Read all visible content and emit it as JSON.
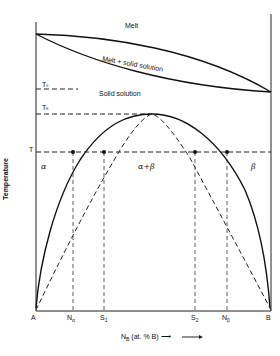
{
  "diagram": {
    "type": "phase-diagram",
    "title": "",
    "regions": {
      "melt": "Melt",
      "melt_solid": "Melt + solid solution",
      "solid_solution": "Solid solution",
      "alpha": "α",
      "alpha_beta": "α+β",
      "beta": "β"
    },
    "temperature_labels": {
      "ts": "Tₛ",
      "tc": "Tₖ",
      "t": "T"
    },
    "axis": {
      "y_label": "Temperature",
      "x_label": "N",
      "x_label_sub": "B",
      "x_label_rest": "(at. % B) ⟶"
    },
    "x_ticks": [
      {
        "main": "A",
        "sub": ""
      },
      {
        "main": "N",
        "sub": "α"
      },
      {
        "main": "S",
        "sub": "1"
      },
      {
        "main": "S",
        "sub": "2"
      },
      {
        "main": "N",
        "sub": "β"
      },
      {
        "main": "B",
        "sub": ""
      }
    ],
    "colors": {
      "line": "#111111",
      "background": "#ffffff"
    }
  }
}
